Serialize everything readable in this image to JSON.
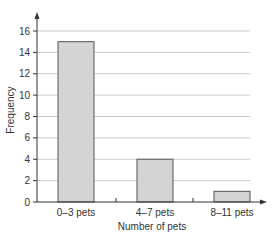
{
  "chart_data": {
    "type": "bar",
    "title": "",
    "xlabel": "Number of pets",
    "ylabel": "Frequency",
    "categories": [
      "0–3 pets",
      "4–7 pets",
      "8–11 pets"
    ],
    "values": [
      15,
      4,
      1
    ],
    "ylim": [
      0,
      16
    ],
    "yticks": [
      0,
      2,
      4,
      6,
      8,
      10,
      12,
      14,
      16
    ],
    "grid": true,
    "legend": null,
    "colors": {
      "bar_fill": "#d4d4d4",
      "bar_stroke": "#555555",
      "grid": "#cccccc",
      "axis": "#333333"
    }
  },
  "axes": {
    "x_title": "Number of pets",
    "y_title": "Frequency",
    "y_tick_labels": [
      "0",
      "2",
      "4",
      "6",
      "8",
      "10",
      "12",
      "14",
      "16"
    ],
    "x_tick_labels": [
      "0–3 pets",
      "4–7 pets",
      "8–11 pets"
    ]
  }
}
